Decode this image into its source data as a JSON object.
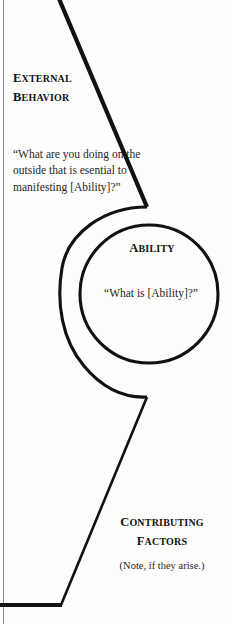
{
  "diagram": {
    "stroke_color": "#111111",
    "background_color": "#fdfdfc",
    "border_color": "#8d8d8d"
  },
  "levels": {
    "external_behavior": {
      "heading_first": "E",
      "heading_rest": "XTERNAL",
      "heading_second_first": "B",
      "heading_second_rest": "EHAVIOR",
      "heading_plain": "EXTERNAL BEHAVIOR",
      "quote": "“What are you doing on the outside that is esential to manifesting [Ability]?”"
    },
    "ability": {
      "heading_first": "A",
      "heading_rest": "BILITY",
      "heading_plain": "ABILITY",
      "quote": "“What is [Ability]?”"
    },
    "contributing_factors": {
      "heading_first": "C",
      "heading_rest": "ONTRIBUTING",
      "heading_second_first": "F",
      "heading_second_rest": "ACTORS",
      "heading_plain": "CONTRIBUTING FACTORS",
      "note": "(Note, if they arise.)"
    }
  }
}
